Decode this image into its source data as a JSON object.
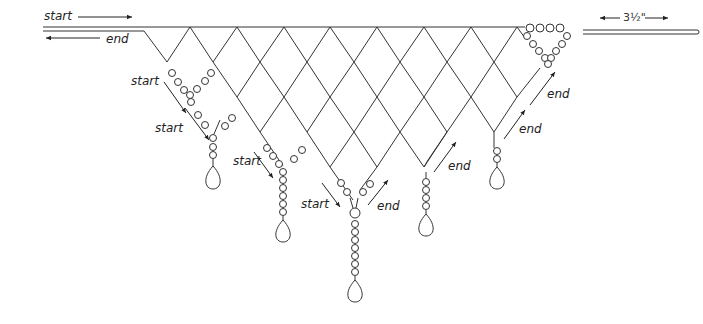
{
  "diagram": {
    "labels": {
      "top_start": "start",
      "top_end": "end",
      "measurement": "3½\"",
      "drop1_start_a": "start",
      "drop1_start_b": "start",
      "drop2_start": "start",
      "drop3_start": "start",
      "drop3_end": "end",
      "drop4_end": "end",
      "drop5_end_a": "end",
      "drop5_end_b": "end"
    },
    "colors": {
      "line": "#333333",
      "background": "#ffffff"
    },
    "grid": {
      "left_x": 144,
      "top_y": 27,
      "half_width": 23.4,
      "row_height": 35,
      "columns": 16
    }
  }
}
